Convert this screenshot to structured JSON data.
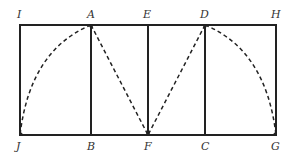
{
  "diagram": {
    "type": "geometric-construction",
    "colors": {
      "background": "#ffffff",
      "stroke": "#222222",
      "label": "#333333"
    },
    "labels": {
      "top": {
        "I": "I",
        "A": "A",
        "E": "E",
        "D": "D",
        "H": "H"
      },
      "bottom": {
        "J": "J",
        "B": "B",
        "F": "F",
        "C": "C",
        "G": "G"
      }
    },
    "points": {
      "I": [
        20,
        25
      ],
      "A": [
        91,
        25
      ],
      "E": [
        148,
        25
      ],
      "D": [
        205,
        25
      ],
      "H": [
        276,
        25
      ],
      "J": [
        20,
        135
      ],
      "B": [
        91,
        135
      ],
      "F": [
        148,
        135
      ],
      "C": [
        205,
        135
      ],
      "G": [
        276,
        135
      ]
    },
    "solid_segments": [
      [
        "I",
        "H"
      ],
      [
        "J",
        "G"
      ],
      [
        "I",
        "J"
      ],
      [
        "A",
        "B"
      ],
      [
        "E",
        "F"
      ],
      [
        "D",
        "C"
      ],
      [
        "H",
        "G"
      ]
    ],
    "dashed_arcs": [
      {
        "from": "A",
        "to": "J",
        "center": "B"
      },
      {
        "from": "D",
        "to": "G",
        "center": "C"
      }
    ],
    "dashed_segments": [
      [
        "A",
        "F"
      ],
      [
        "D",
        "F"
      ]
    ]
  }
}
